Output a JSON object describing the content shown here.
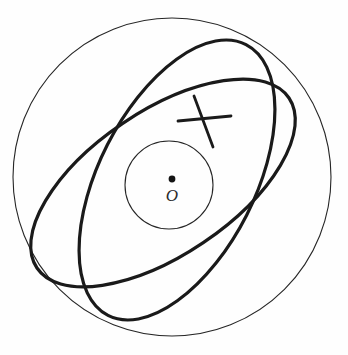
{
  "figure": {
    "background_color": "#fefefe",
    "stroke_color": "#1a1a1a",
    "thin_stroke_color": "#262626",
    "width": 348,
    "height": 355
  },
  "labels": {
    "center_point": "O"
  },
  "chart_data": {
    "type": "diagram",
    "xlabel": "",
    "ylabel": "",
    "xlim": [
      0,
      348
    ],
    "ylim": [
      0,
      355
    ],
    "grid": false,
    "legend": "none",
    "shapes": [
      {
        "name": "outer-circle",
        "kind": "circle",
        "cx": 172,
        "cy": 177,
        "r": 159,
        "rotation": 0,
        "stroke_weight": "thin",
        "color": "#262626"
      },
      {
        "name": "inner-circle",
        "kind": "circle",
        "cx": 169,
        "cy": 185,
        "r": 44,
        "rotation": 0,
        "stroke_weight": "thin",
        "color": "#262626"
      },
      {
        "name": "ellipse-steep",
        "kind": "ellipse",
        "cx": 177,
        "cy": 180,
        "rx": 78,
        "ry": 152,
        "rotation": 27,
        "stroke_weight": "thick",
        "color": "#1a1a1a"
      },
      {
        "name": "ellipse-shallow",
        "kind": "ellipse",
        "cx": 163,
        "cy": 183,
        "rx": 152,
        "ry": 72,
        "rotation": -34,
        "stroke_weight": "thick",
        "color": "#1a1a1a"
      }
    ],
    "segments": [
      {
        "name": "tick-mark-steep",
        "x1": 194,
        "y1": 96,
        "x2": 213,
        "y2": 147,
        "stroke_weight": "tick",
        "color": "#1a1a1a"
      },
      {
        "name": "tick-mark-horizontal",
        "x1": 178,
        "y1": 121,
        "x2": 231,
        "y2": 116,
        "stroke_weight": "tick",
        "color": "#1a1a1a"
      }
    ],
    "points": [
      {
        "name": "center-point",
        "label": "O",
        "x": 172,
        "y": 179,
        "radius": 3.4,
        "label_x": 172,
        "label_y": 201,
        "color": "#141414"
      }
    ]
  }
}
